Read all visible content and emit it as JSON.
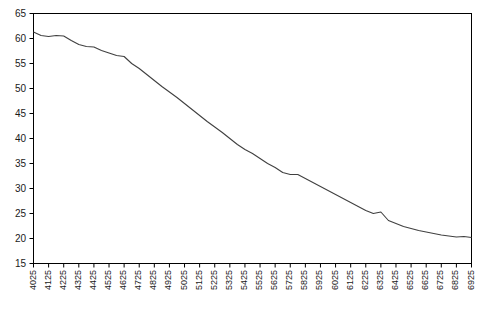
{
  "chart_data": {
    "type": "line",
    "title": "",
    "subtitle": "",
    "xlabel": "",
    "ylabel": "",
    "grid": false,
    "legend": false,
    "legend_position": "none",
    "line_color": "#404040",
    "axis_color": "#000000",
    "background": "#ffffff",
    "xlim": [
      4025,
      6925
    ],
    "ylim": [
      15,
      65
    ],
    "ytick_step": 5,
    "xtick_step": 100,
    "yticks": [
      65,
      60,
      55,
      50,
      45,
      40,
      35,
      30,
      25,
      20,
      15
    ],
    "xticks": [
      "4025",
      "4125",
      "4225",
      "4325",
      "4425",
      "4525",
      "4625",
      "4725",
      "4825",
      "4925",
      "5025",
      "5125",
      "5225",
      "5325",
      "5425",
      "5525",
      "5625",
      "5725",
      "5825",
      "5925",
      "6025",
      "6125",
      "6225",
      "6325",
      "6425",
      "6525",
      "6625",
      "6725",
      "6825",
      "6925"
    ],
    "x": [
      4025,
      4075,
      4125,
      4175,
      4225,
      4275,
      4325,
      4375,
      4425,
      4475,
      4525,
      4575,
      4625,
      4675,
      4725,
      4775,
      4825,
      4875,
      4925,
      4975,
      5025,
      5075,
      5125,
      5175,
      5225,
      5275,
      5325,
      5375,
      5425,
      5475,
      5525,
      5575,
      5625,
      5675,
      5725,
      5775,
      5825,
      5875,
      5925,
      5975,
      6025,
      6075,
      6125,
      6175,
      6225,
      6275,
      6325,
      6375,
      6425,
      6475,
      6525,
      6575,
      6625,
      6675,
      6725,
      6775,
      6825,
      6875,
      6925
    ],
    "values": [
      61.3,
      60.6,
      60.4,
      60.6,
      60.5,
      59.6,
      58.8,
      58.4,
      58.3,
      57.6,
      57.1,
      56.6,
      56.4,
      55.0,
      54.0,
      52.8,
      51.6,
      50.4,
      49.3,
      48.2,
      47.0,
      45.8,
      44.6,
      43.4,
      42.3,
      41.2,
      40.0,
      38.8,
      37.8,
      37.0,
      36.0,
      35.0,
      34.2,
      33.2,
      32.8,
      32.8,
      32.0,
      31.2,
      30.4,
      29.6,
      28.8,
      28.0,
      27.2,
      26.4,
      25.6,
      25.0,
      25.3,
      23.6,
      23.0,
      22.4,
      22.0,
      21.6,
      21.3,
      21.0,
      20.7,
      20.5,
      20.3,
      20.4,
      20.2
    ],
    "series": [
      {
        "name": "series-1",
        "values": [
          61.3,
          60.6,
          60.4,
          60.6,
          60.5,
          59.6,
          58.8,
          58.4,
          58.3,
          57.6,
          57.1,
          56.6,
          56.4,
          55.0,
          54.0,
          52.8,
          51.6,
          50.4,
          49.3,
          48.2,
          47.0,
          45.8,
          44.6,
          43.4,
          42.3,
          41.2,
          40.0,
          38.8,
          37.8,
          37.0,
          36.0,
          35.0,
          34.2,
          33.2,
          32.8,
          32.8,
          32.0,
          31.2,
          30.4,
          29.6,
          28.8,
          28.0,
          27.2,
          26.4,
          25.6,
          25.0,
          25.3,
          23.6,
          23.0,
          22.4,
          22.0,
          21.6,
          21.3,
          21.0,
          20.7,
          20.5,
          20.3,
          20.4,
          20.2
        ]
      }
    ],
    "annotations": []
  }
}
